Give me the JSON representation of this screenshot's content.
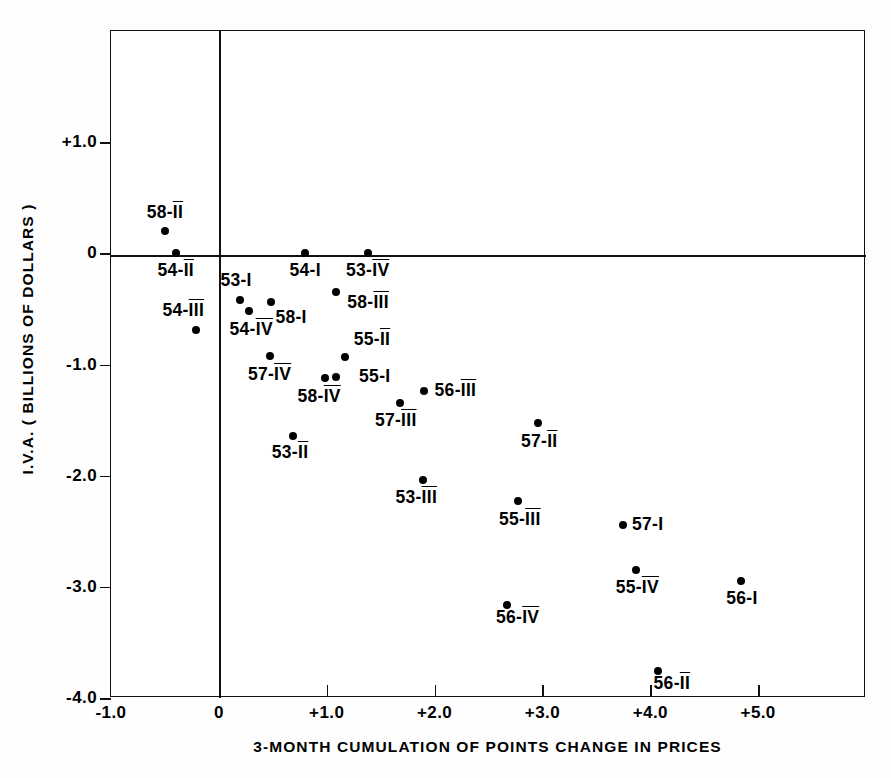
{
  "chart_data": {
    "type": "scatter",
    "title": "",
    "xlabel": "3-MONTH CUMULATION OF POINTS CHANGE IN PRICES",
    "ylabel": "I.V.A. ( BILLIONS OF DOLLARS )",
    "xlim": [
      -1.0,
      6.0
    ],
    "ylim": [
      -4.0,
      2.0
    ],
    "xticks": [
      "-1.0",
      "0",
      "+1.0",
      "+2.0",
      "+3.0",
      "+4.0",
      "+5.0"
    ],
    "xtickvals": [
      -1.0,
      0,
      1.0,
      2.0,
      3.0,
      4.0,
      5.0
    ],
    "yticks": [
      "+1.0",
      "0",
      "-1.0",
      "-2.0",
      "-3.0",
      "-4.0"
    ],
    "ytickvals": [
      1.0,
      0,
      -1.0,
      -2.0,
      -3.0,
      -4.0
    ],
    "grid": false,
    "legend": "none",
    "zero_lines": {
      "x": 0,
      "y": 0
    },
    "points": [
      {
        "label": "58-II",
        "x": -0.5,
        "y": 0.2,
        "lx": -0.5,
        "ly": 0.36,
        "anchor": "center"
      },
      {
        "label": "54-II",
        "x": -0.4,
        "y": 0.0,
        "lx": -0.4,
        "ly": -0.16,
        "anchor": "center"
      },
      {
        "label": "54-III",
        "x": -0.21,
        "y": -0.69,
        "lx": -0.33,
        "ly": -0.52,
        "anchor": "center"
      },
      {
        "label": "53-I",
        "x": 0.2,
        "y": -0.42,
        "lx": 0.16,
        "ly": -0.25,
        "anchor": "center"
      },
      {
        "label": "54-IV",
        "x": 0.28,
        "y": -0.52,
        "lx": 0.3,
        "ly": -0.69,
        "anchor": "center"
      },
      {
        "label": "58-I",
        "x": 0.48,
        "y": -0.44,
        "lx": 0.67,
        "ly": -0.58,
        "anchor": "center"
      },
      {
        "label": "57-IV",
        "x": 0.47,
        "y": -0.92,
        "lx": 0.47,
        "ly": -1.09,
        "anchor": "center"
      },
      {
        "label": "53-II",
        "x": 0.69,
        "y": -1.64,
        "lx": 0.66,
        "ly": -1.8,
        "anchor": "center"
      },
      {
        "label": "54-I",
        "x": 0.8,
        "y": 0.0,
        "lx": 0.8,
        "ly": -0.16,
        "anchor": "center"
      },
      {
        "label": "58-IV",
        "x": 0.98,
        "y": -1.12,
        "lx": 0.93,
        "ly": -1.29,
        "anchor": "center"
      },
      {
        "label": "55-I",
        "x": 1.09,
        "y": -1.11,
        "lx": 1.3,
        "ly": -1.11,
        "anchor": "left"
      },
      {
        "label": "58-III",
        "x": 1.09,
        "y": -0.35,
        "lx": 1.19,
        "ly": -0.45,
        "anchor": "left"
      },
      {
        "label": "55-II",
        "x": 1.17,
        "y": -0.93,
        "lx": 1.25,
        "ly": -0.78,
        "anchor": "left"
      },
      {
        "label": "53-IV",
        "x": 1.38,
        "y": 0.0,
        "lx": 1.38,
        "ly": -0.16,
        "anchor": "center"
      },
      {
        "label": "57-III",
        "x": 1.68,
        "y": -1.35,
        "lx": 1.64,
        "ly": -1.51,
        "anchor": "center"
      },
      {
        "label": "56-III",
        "x": 1.9,
        "y": -1.24,
        "lx": 2.0,
        "ly": -1.24,
        "anchor": "left"
      },
      {
        "label": "53-III",
        "x": 1.89,
        "y": -2.04,
        "lx": 1.83,
        "ly": -2.2,
        "anchor": "center"
      },
      {
        "label": "56-IV",
        "x": 2.67,
        "y": -3.16,
        "lx": 2.77,
        "ly": -3.28,
        "anchor": "center"
      },
      {
        "label": "55-III",
        "x": 2.77,
        "y": -2.23,
        "lx": 2.79,
        "ly": -2.4,
        "anchor": "center"
      },
      {
        "label": "57-II",
        "x": 2.96,
        "y": -1.53,
        "lx": 2.97,
        "ly": -1.7,
        "anchor": "center"
      },
      {
        "label": "57-I",
        "x": 3.75,
        "y": -2.44,
        "lx": 3.83,
        "ly": -2.44,
        "anchor": "left"
      },
      {
        "label": "55-IV",
        "x": 3.87,
        "y": -2.85,
        "lx": 3.88,
        "ly": -3.01,
        "anchor": "center"
      },
      {
        "label": "56-II",
        "x": 4.07,
        "y": -3.76,
        "lx": 4.2,
        "ly": -3.87,
        "anchor": "center"
      },
      {
        "label": "56-I",
        "x": 4.84,
        "y": -2.95,
        "lx": 4.85,
        "ly": -3.11,
        "anchor": "center"
      }
    ]
  }
}
